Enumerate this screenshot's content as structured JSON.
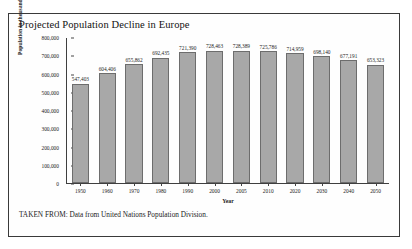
{
  "figure": {
    "title": "Projected Population Decline in Europe",
    "source_note": "TAKEN FROM: Data from United Nations Population Division."
  },
  "chart_data": {
    "type": "bar",
    "title": "Projected Population Decline in Europe",
    "xlabel": "Year",
    "ylabel": "Population in thousands",
    "categories": [
      "1950",
      "1960",
      "1970",
      "1980",
      "1990",
      "2000",
      "2005",
      "2010",
      "2020",
      "2030",
      "2040",
      "2050"
    ],
    "values": [
      547403,
      604406,
      655862,
      692435,
      721390,
      728463,
      728389,
      725786,
      714959,
      698140,
      677191,
      653323
    ],
    "value_labels": [
      "547,403",
      "604,406",
      "655,862",
      "692,435",
      "721,390",
      "728,463",
      "728,389",
      "725,786",
      "714,959",
      "698,140",
      "677,191",
      "653,323"
    ],
    "ylim": [
      0,
      800000
    ],
    "yticks": [
      0,
      100000,
      200000,
      300000,
      400000,
      500000,
      600000,
      700000,
      800000
    ],
    "ytick_labels": [
      "0",
      "100,000",
      "200,000",
      "300,000",
      "400,000",
      "500,000",
      "600,000",
      "700,000",
      "800,000"
    ],
    "grid": false,
    "legend": false,
    "bar_color": "#a8a8a8",
    "bar_edge_color": "#6d6d6d"
  }
}
